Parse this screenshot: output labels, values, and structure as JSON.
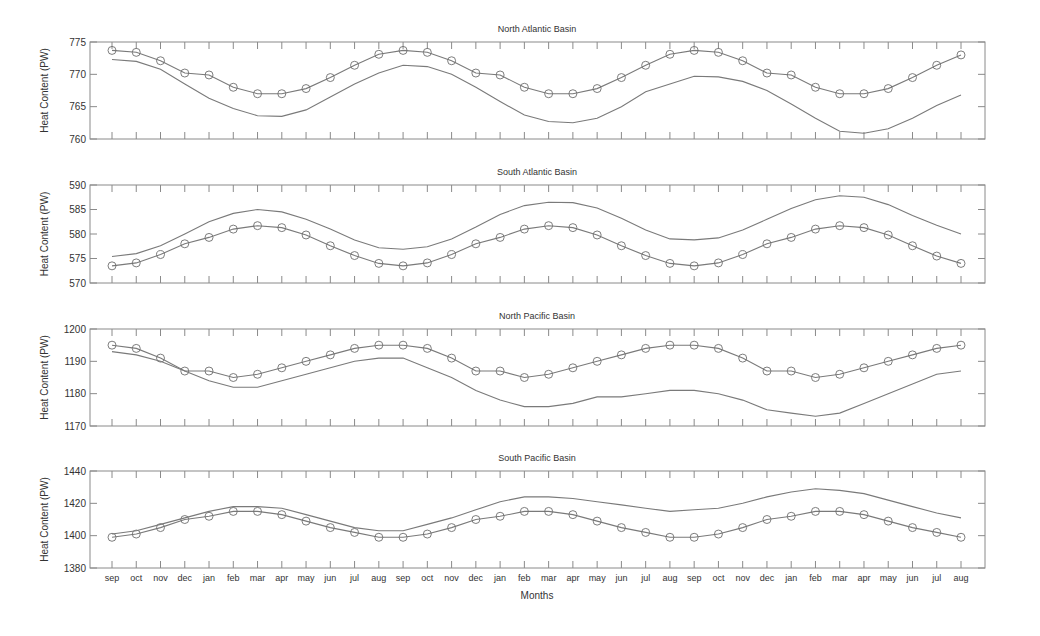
{
  "figure": {
    "xlabel": "Months",
    "ylabel": "Heat Content (PW)",
    "months": [
      "sep",
      "oct",
      "nov",
      "dec",
      "jan",
      "feb",
      "mar",
      "apr",
      "may",
      "jun",
      "jul",
      "aug",
      "sep",
      "oct",
      "nov",
      "dec",
      "jan",
      "feb",
      "mar",
      "apr",
      "may",
      "jun",
      "jul",
      "aug",
      "sep",
      "oct",
      "nov",
      "dec",
      "jan",
      "feb",
      "mar",
      "apr",
      "may",
      "jun",
      "jul",
      "aug"
    ],
    "colors": {
      "line": "#7a7a7a",
      "marker": "#6e6e6e",
      "axis": "#8a8a8a",
      "text": "#333333"
    }
  },
  "chart_data": [
    {
      "type": "line",
      "title": "North Atlantic Basin",
      "xlabel": "",
      "ylabel": "Heat Content (PW)",
      "ylim": [
        760,
        775
      ],
      "yticks": [
        760,
        765,
        770,
        775
      ],
      "grid": false,
      "categories": [
        "sep",
        "oct",
        "nov",
        "dec",
        "jan",
        "feb",
        "mar",
        "apr",
        "may",
        "jun",
        "jul",
        "aug",
        "sep",
        "oct",
        "nov",
        "dec",
        "jan",
        "feb",
        "mar",
        "apr",
        "may",
        "jun",
        "jul",
        "aug",
        "sep",
        "oct",
        "nov",
        "dec",
        "jan",
        "feb",
        "mar",
        "apr",
        "may",
        "jun",
        "jul",
        "aug"
      ],
      "series": [
        {
          "name": "circles",
          "marker": "o",
          "values": [
            773.7,
            773.4,
            772.1,
            770.2,
            769.9,
            768.0,
            767.0,
            767.0,
            767.8,
            769.5,
            771.4,
            773.1,
            773.7,
            773.4,
            772.1,
            770.2,
            769.9,
            768.0,
            767.0,
            767.0,
            767.8,
            769.5,
            771.4,
            773.1,
            773.7,
            773.4,
            772.1,
            770.2,
            769.9,
            768.0,
            767.0,
            767.0,
            767.8,
            769.5,
            771.4,
            773.0
          ]
        },
        {
          "name": "line",
          "marker": "none",
          "values": [
            772.3,
            772.0,
            770.8,
            768.5,
            766.3,
            764.7,
            763.6,
            763.5,
            764.5,
            766.5,
            768.5,
            770.2,
            771.4,
            771.2,
            770.0,
            768.0,
            765.8,
            763.7,
            762.7,
            762.5,
            763.2,
            765.0,
            767.3,
            768.5,
            769.7,
            769.6,
            768.9,
            767.5,
            765.4,
            763.2,
            761.2,
            760.9,
            761.6,
            763.2,
            765.2,
            766.8
          ]
        }
      ]
    },
    {
      "type": "line",
      "title": "South Atlantic Basin",
      "xlabel": "",
      "ylabel": "Heat Content (PW)",
      "ylim": [
        570,
        590
      ],
      "yticks": [
        570,
        575,
        580,
        585,
        590
      ],
      "grid": false,
      "categories": [
        "sep",
        "oct",
        "nov",
        "dec",
        "jan",
        "feb",
        "mar",
        "apr",
        "may",
        "jun",
        "jul",
        "aug",
        "sep",
        "oct",
        "nov",
        "dec",
        "jan",
        "feb",
        "mar",
        "apr",
        "may",
        "jun",
        "jul",
        "aug",
        "sep",
        "oct",
        "nov",
        "dec",
        "jan",
        "feb",
        "mar",
        "apr",
        "may",
        "jun",
        "jul",
        "aug"
      ],
      "series": [
        {
          "name": "circles",
          "marker": "o",
          "values": [
            573.5,
            574.1,
            575.8,
            578.0,
            579.3,
            581.0,
            581.7,
            581.3,
            579.8,
            577.6,
            575.6,
            574.0,
            573.5,
            574.1,
            575.8,
            578.0,
            579.3,
            581.0,
            581.7,
            581.3,
            579.8,
            577.6,
            575.6,
            574.0,
            573.5,
            574.1,
            575.8,
            578.0,
            579.3,
            581.0,
            581.7,
            581.3,
            579.8,
            577.6,
            575.5,
            574.0
          ]
        },
        {
          "name": "line",
          "marker": "none",
          "values": [
            575.4,
            576.0,
            577.6,
            580.0,
            582.5,
            584.2,
            585.0,
            584.5,
            583.0,
            581.0,
            578.8,
            577.2,
            576.9,
            577.4,
            579.0,
            581.4,
            584.0,
            585.8,
            586.5,
            586.4,
            585.3,
            583.2,
            580.8,
            579.0,
            578.8,
            579.2,
            580.8,
            583.0,
            585.2,
            587.0,
            587.8,
            587.5,
            586.0,
            583.8,
            581.8,
            580.0
          ]
        }
      ]
    },
    {
      "type": "line",
      "title": "North Pacific Basin",
      "xlabel": "",
      "ylabel": "Heat Content (PW)",
      "ylim": [
        1170,
        1200
      ],
      "yticks": [
        1170,
        1180,
        1190,
        1200
      ],
      "grid": false,
      "categories": [
        "sep",
        "oct",
        "nov",
        "dec",
        "jan",
        "feb",
        "mar",
        "apr",
        "may",
        "jun",
        "jul",
        "aug",
        "sep",
        "oct",
        "nov",
        "dec",
        "jan",
        "feb",
        "mar",
        "apr",
        "may",
        "jun",
        "jul",
        "aug",
        "sep",
        "oct",
        "nov",
        "dec",
        "jan",
        "feb",
        "mar",
        "apr",
        "may",
        "jun",
        "jul",
        "aug"
      ],
      "series": [
        {
          "name": "circles",
          "marker": "o",
          "values": [
            1195,
            1194,
            1191,
            1187,
            1187,
            1185,
            1186,
            1188,
            1190,
            1192,
            1194,
            1195,
            1195,
            1194,
            1191,
            1187,
            1187,
            1185,
            1186,
            1188,
            1190,
            1192,
            1194,
            1195,
            1195,
            1194,
            1191,
            1187,
            1187,
            1185,
            1186,
            1188,
            1190,
            1192,
            1194,
            1195
          ]
        },
        {
          "name": "line",
          "marker": "none",
          "values": [
            1193,
            1192,
            1190,
            1187,
            1184,
            1182,
            1182,
            1184,
            1186,
            1188,
            1190,
            1191,
            1191,
            1188,
            1185,
            1181,
            1178,
            1176,
            1176,
            1177,
            1179,
            1179,
            1180,
            1181,
            1181,
            1180,
            1178,
            1175,
            1174,
            1173,
            1174,
            1177,
            1180,
            1183,
            1186,
            1187
          ]
        }
      ]
    },
    {
      "type": "line",
      "title": "South Pacific Basin",
      "xlabel": "Months",
      "ylabel": "Heat Content (PW)",
      "ylim": [
        1380,
        1440
      ],
      "yticks": [
        1380,
        1400,
        1420,
        1440
      ],
      "grid": false,
      "categories": [
        "sep",
        "oct",
        "nov",
        "dec",
        "jan",
        "feb",
        "mar",
        "apr",
        "may",
        "jun",
        "jul",
        "aug",
        "sep",
        "oct",
        "nov",
        "dec",
        "jan",
        "feb",
        "mar",
        "apr",
        "may",
        "jun",
        "jul",
        "aug",
        "sep",
        "oct",
        "nov",
        "dec",
        "jan",
        "feb",
        "mar",
        "apr",
        "may",
        "jun",
        "jul",
        "aug"
      ],
      "series": [
        {
          "name": "circles",
          "marker": "o",
          "values": [
            1399,
            1401,
            1405,
            1410,
            1412,
            1415,
            1415,
            1413,
            1409,
            1405,
            1402,
            1399,
            1399,
            1401,
            1405,
            1410,
            1412,
            1415,
            1415,
            1413,
            1409,
            1405,
            1402,
            1399,
            1399,
            1401,
            1405,
            1410,
            1412,
            1415,
            1415,
            1413,
            1409,
            1405,
            1402,
            1399
          ]
        },
        {
          "name": "line",
          "marker": "none",
          "values": [
            1401,
            1403,
            1407,
            1411,
            1415,
            1418,
            1418,
            1417,
            1413,
            1409,
            1405,
            1403,
            1403,
            1407,
            1411,
            1416,
            1421,
            1424,
            1424,
            1423,
            1421,
            1419,
            1417,
            1415,
            1416,
            1417,
            1420,
            1424,
            1427,
            1429,
            1428,
            1426,
            1422,
            1418,
            1414,
            1411
          ]
        }
      ]
    }
  ]
}
